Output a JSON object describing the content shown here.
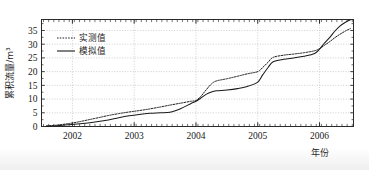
{
  "chart_data": {
    "type": "line",
    "title": "",
    "xlabel": "年份",
    "ylabel": "累积流量/m³",
    "xlim": [
      2001.5,
      2006.55
    ],
    "ylim": [
      0,
      39
    ],
    "yticks": [
      0,
      5,
      10,
      15,
      20,
      25,
      30,
      35
    ],
    "ytick_labels": [
      "0",
      "5",
      "10",
      "15",
      "20",
      "25",
      "30",
      "35"
    ],
    "xticks": [
      2002,
      2003,
      2004,
      2005,
      2006
    ],
    "xtick_labels": [
      "2002",
      "2003",
      "2004",
      "2005",
      "2006"
    ],
    "minor_x_tick_interval": 0.0833,
    "grid": true,
    "grid_style": "dotted",
    "legend": {
      "position": "upper-left-inside",
      "entries": [
        {
          "label": "实测值",
          "style": "dotted"
        },
        {
          "label": "模拟值",
          "style": "solid"
        }
      ]
    },
    "series": [
      {
        "name": "实测值",
        "style": "dotted",
        "color": "#1a1a1a",
        "x": [
          2001.58,
          2001.75,
          2001.92,
          2002.08,
          2002.25,
          2002.42,
          2002.58,
          2002.75,
          2002.92,
          2003.08,
          2003.25,
          2003.42,
          2003.58,
          2003.75,
          2003.92,
          2004.0,
          2004.08,
          2004.17,
          2004.25,
          2004.33,
          2004.5,
          2004.67,
          2004.83,
          2005.0,
          2005.08,
          2005.17,
          2005.25,
          2005.42,
          2005.58,
          2005.75,
          2005.92,
          2006.0,
          2006.08,
          2006.17,
          2006.25,
          2006.33,
          2006.42,
          2006.5
        ],
        "y": [
          0.2,
          0.5,
          1.0,
          1.6,
          2.4,
          3.2,
          4.0,
          4.7,
          5.3,
          5.8,
          6.4,
          7.1,
          7.8,
          8.5,
          9.2,
          9.5,
          11.0,
          13.5,
          15.5,
          16.6,
          17.4,
          18.3,
          19.2,
          20.0,
          21.5,
          23.5,
          25.2,
          26.0,
          26.4,
          26.9,
          27.6,
          28.4,
          29.6,
          31.0,
          32.4,
          33.6,
          34.8,
          35.7
        ]
      },
      {
        "name": "模拟值",
        "style": "solid",
        "color": "#1a1a1a",
        "x": [
          2001.58,
          2001.75,
          2001.92,
          2002.08,
          2002.25,
          2002.42,
          2002.58,
          2002.75,
          2002.92,
          2003.08,
          2003.25,
          2003.42,
          2003.58,
          2003.75,
          2003.92,
          2004.0,
          2004.08,
          2004.17,
          2004.25,
          2004.33,
          2004.5,
          2004.67,
          2004.83,
          2005.0,
          2005.08,
          2005.17,
          2005.25,
          2005.42,
          2005.58,
          2005.75,
          2005.92,
          2006.0,
          2006.08,
          2006.17,
          2006.25,
          2006.33,
          2006.42,
          2006.5
        ],
        "y": [
          0.1,
          0.3,
          0.6,
          0.9,
          1.3,
          1.8,
          2.4,
          3.2,
          3.9,
          4.4,
          4.8,
          5.0,
          5.2,
          6.5,
          8.4,
          9.2,
          10.4,
          11.8,
          12.6,
          13.0,
          13.3,
          13.8,
          14.6,
          16.2,
          18.8,
          21.6,
          23.6,
          24.5,
          25.0,
          25.6,
          26.6,
          28.2,
          30.4,
          32.6,
          34.8,
          36.6,
          38.0,
          38.9
        ]
      }
    ]
  }
}
